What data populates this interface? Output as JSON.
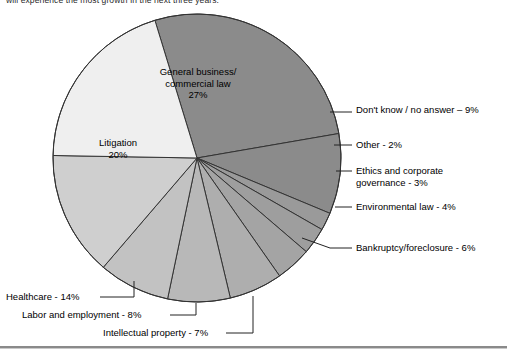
{
  "caption": {
    "text": "will experience the most growth in the next three years:"
  },
  "chart_data": {
    "type": "pie",
    "title": "",
    "start_angle_deg": -17,
    "direction": "clockwise",
    "center": {
      "x": 197,
      "y": 158
    },
    "radius": 144,
    "legend_position": "callouts",
    "categories": [
      "General business/ commercial law",
      "Don't know / no answer",
      "Other",
      "Ethics and corporate governance",
      "Environmental law",
      "Bankruptcy/foreclosure",
      "Intellectual property",
      "Labor and employment",
      "Healthcare",
      "Litigation"
    ],
    "values": [
      27,
      9,
      2,
      3,
      4,
      6,
      7,
      8,
      14,
      20
    ],
    "colors": [
      "#8b8b8b",
      "#8b8b8b",
      "#9a9a9a",
      "#9e9e9e",
      "#a4a4a4",
      "#aeaeae",
      "#b8b8b8",
      "#c2c2c2",
      "#cfcfcf",
      "#efefef"
    ],
    "slices": [
      {
        "label": "General business/ commercial law",
        "value": 27,
        "color": "#8b8b8b",
        "label_placement": "inside"
      },
      {
        "label": "Don't know / no answer",
        "value": 9,
        "color": "#8b8b8b",
        "label_placement": "callout-right"
      },
      {
        "label": "Other",
        "value": 2,
        "color": "#9a9a9a",
        "label_placement": "callout-right"
      },
      {
        "label": "Ethics and corporate governance",
        "value": 3,
        "color": "#9e9e9e",
        "label_placement": "callout-right"
      },
      {
        "label": "Environmental law",
        "value": 4,
        "color": "#a4a4a4",
        "label_placement": "callout-right"
      },
      {
        "label": "Bankruptcy/foreclosure",
        "value": 6,
        "color": "#aeaeae",
        "label_placement": "callout-right"
      },
      {
        "label": "Intellectual property",
        "value": 7,
        "color": "#b8b8b8",
        "label_placement": "callout-bottom"
      },
      {
        "label": "Labor and employment",
        "value": 8,
        "color": "#c2c2c2",
        "label_placement": "callout-bottom"
      },
      {
        "label": "Healthcare",
        "value": 14,
        "color": "#cfcfcf",
        "label_placement": "callout-left"
      },
      {
        "label": "Litigation",
        "value": 20,
        "color": "#efefef",
        "label_placement": "inside"
      }
    ]
  },
  "labels": {
    "general_line1": "General business/",
    "general_line2": "commercial law",
    "general_pct": "27%",
    "litigation_line1": "Litigation",
    "litigation_pct": "20%",
    "dont_know": "Don't know / no answer – 9%",
    "other": "Other - 2%",
    "ethics_line1": "Ethics and corporate",
    "ethics_line2": "governance - 3%",
    "environmental": "Environmental law - 4%",
    "bankruptcy": "Bankruptcy/foreclosure - 6%",
    "healthcare": "Healthcare - 14%",
    "labor": "Labor and employment - 8%",
    "intellectual": "Intellectual property - 7%"
  }
}
